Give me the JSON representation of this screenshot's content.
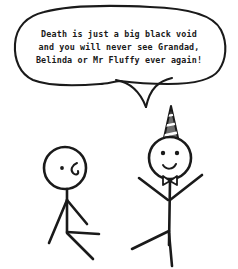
{
  "comic": {
    "title": "Stick figure comic",
    "background_color": "#ffffff",
    "ink_color": "#1a1a1a",
    "width": 238,
    "height": 269
  },
  "speech_bubble": {
    "speaker": "right-figure",
    "lines": [
      "Death is just a big black void",
      "and you will never see Grandad,",
      "Belinda or Mr Fluffy ever again!"
    ],
    "full_text": "Death is just a big black void and you will never see Grandad, Belinda or Mr Fluffy ever again!",
    "stroke_color": "#1a1a1a",
    "fill_color": "#ffffff"
  },
  "figures": [
    {
      "id": "left-figure",
      "name": "sad-stick-figure",
      "mood": "sad",
      "expression": "frown",
      "eyes": 1,
      "accessories": [],
      "pose": "arms down, seated/slumped legs"
    },
    {
      "id": "right-figure",
      "name": "happy-stick-figure",
      "mood": "happy",
      "expression": "smile",
      "eyes": 2,
      "accessories": [
        "party-hat",
        "bow-tie"
      ],
      "pose": "arms raised in celebration",
      "party_hat_color": "#6e6e6e",
      "party_hat_stripe_color": "#ffffff"
    }
  ]
}
